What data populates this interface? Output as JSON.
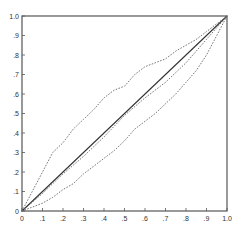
{
  "chart_data": {
    "type": "scatter",
    "title": "",
    "xlabel": "",
    "ylabel": "",
    "xlim": [
      0,
      1.0
    ],
    "ylim": [
      0,
      1.0
    ],
    "grid": false,
    "legend": null,
    "x_ticks": [
      "0",
      ".1",
      ".2",
      ".3",
      ".4",
      ".5",
      ".6",
      ".7",
      ".8",
      ".9",
      "1.0"
    ],
    "y_ticks": [
      "0",
      ".1",
      ".2",
      ".3",
      ".4",
      ".5",
      ".6",
      ".7",
      ".8",
      ".9",
      "1.0"
    ],
    "series": [
      {
        "name": "diagonal",
        "style": "solid-line",
        "x": [
          0,
          1.0
        ],
        "y": [
          0,
          1.0
        ]
      },
      {
        "name": "upper-band",
        "style": "dotted",
        "x": [
          0,
          0.05,
          0.1,
          0.15,
          0.2,
          0.25,
          0.3,
          0.35,
          0.4,
          0.45,
          0.5,
          0.55,
          0.6,
          0.65,
          0.7,
          0.75,
          0.8,
          0.85,
          0.9,
          0.95,
          1.0
        ],
        "y": [
          0,
          0.1,
          0.2,
          0.3,
          0.35,
          0.42,
          0.47,
          0.52,
          0.58,
          0.62,
          0.64,
          0.7,
          0.74,
          0.76,
          0.78,
          0.82,
          0.85,
          0.88,
          0.92,
          0.96,
          1.0
        ]
      },
      {
        "name": "middle",
        "style": "dotted",
        "x": [
          0,
          0.1,
          0.2,
          0.3,
          0.4,
          0.5,
          0.6,
          0.7,
          0.8,
          0.9,
          1.0
        ],
        "y": [
          0,
          0.09,
          0.19,
          0.28,
          0.38,
          0.49,
          0.58,
          0.66,
          0.76,
          0.88,
          1.0
        ]
      },
      {
        "name": "lower-band",
        "style": "dotted",
        "x": [
          0,
          0.05,
          0.1,
          0.15,
          0.2,
          0.25,
          0.3,
          0.35,
          0.4,
          0.45,
          0.5,
          0.55,
          0.6,
          0.65,
          0.7,
          0.75,
          0.8,
          0.85,
          0.9,
          0.95,
          1.0
        ],
        "y": [
          0,
          0.02,
          0.04,
          0.07,
          0.11,
          0.14,
          0.19,
          0.23,
          0.27,
          0.31,
          0.36,
          0.42,
          0.46,
          0.5,
          0.55,
          0.6,
          0.66,
          0.72,
          0.8,
          0.9,
          1.0
        ]
      }
    ]
  },
  "colors": {
    "axis": "#555555",
    "line": "#333333",
    "dots": "#666666"
  }
}
